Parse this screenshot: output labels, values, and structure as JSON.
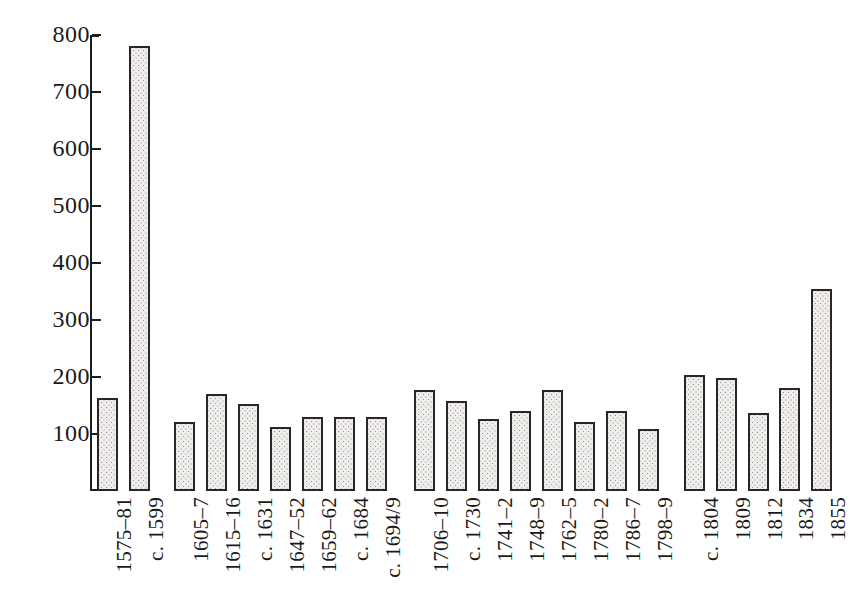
{
  "chart_data": {
    "type": "bar",
    "title": "",
    "subtitle": "",
    "xlabel": "",
    "ylabel": "",
    "ylim": [
      0,
      800
    ],
    "yticks": [
      100,
      200,
      300,
      400,
      500,
      600,
      700,
      800
    ],
    "ytick_labels": [
      "100",
      "200",
      "300",
      "400",
      "500",
      "600",
      "700",
      "800"
    ],
    "grid": false,
    "legend": null,
    "axis_style": "left spine with end caps, ticks outward",
    "bar_style": "stippled grey fill with dark outline",
    "colors": {
      "bar_fill": "#efeeec",
      "bar_dot": "#8d8a86",
      "bar_border": "#2b2623",
      "axis": "#201c1a",
      "text": "#1a1a1a",
      "background": "#ffffff"
    },
    "group_gaps_after": [
      "c. 1599",
      "c. 1694/9",
      "1798-9"
    ],
    "categories": [
      "1575–81",
      "c. 1599",
      "1605–7",
      "1615–16",
      "c. 1631",
      "1647–52",
      "1659–62",
      "c. 1684",
      "c. 1694/9",
      "1706–10",
      "c. 1730",
      "1741–2",
      "1748–9",
      "1762–5",
      "1780–2",
      "1786–7",
      "1798–9",
      "c. 1804",
      "1809",
      "1812",
      "1834",
      "1855"
    ],
    "values": [
      164,
      781,
      121,
      170,
      152,
      112,
      130,
      130,
      130,
      177,
      158,
      127,
      141,
      178,
      121,
      141,
      108,
      204,
      199,
      137,
      180,
      355
    ],
    "bars": [
      {
        "label": "1575–81",
        "value": 164,
        "x": 97,
        "group": 1
      },
      {
        "label": "c. 1599",
        "value": 781,
        "x": 129,
        "group": 1
      },
      {
        "label": "1605–7",
        "value": 121,
        "x": 174,
        "group": 2
      },
      {
        "label": "1615–16",
        "value": 170,
        "x": 206,
        "group": 2
      },
      {
        "label": "c. 1631",
        "value": 152,
        "x": 238,
        "group": 2
      },
      {
        "label": "1647–52",
        "value": 112,
        "x": 270,
        "group": 2
      },
      {
        "label": "1659–62",
        "value": 130,
        "x": 302,
        "group": 2
      },
      {
        "label": "c. 1684",
        "value": 130,
        "x": 334,
        "group": 2
      },
      {
        "label": "c. 1694/9",
        "value": 130,
        "x": 366,
        "group": 2
      },
      {
        "label": "1706–10",
        "value": 177,
        "x": 414,
        "group": 3
      },
      {
        "label": "c. 1730",
        "value": 158,
        "x": 446,
        "group": 3
      },
      {
        "label": "1741–2",
        "value": 127,
        "x": 478,
        "group": 3
      },
      {
        "label": "1748–9",
        "value": 141,
        "x": 510,
        "group": 3
      },
      {
        "label": "1762–5",
        "value": 178,
        "x": 542,
        "group": 3
      },
      {
        "label": "1780–2",
        "value": 121,
        "x": 574,
        "group": 3
      },
      {
        "label": "1786–7",
        "value": 141,
        "x": 606,
        "group": 3
      },
      {
        "label": "1798–9",
        "value": 108,
        "x": 638,
        "group": 3
      },
      {
        "label": "c. 1804",
        "value": 204,
        "x": 684,
        "group": 4
      },
      {
        "label": "1809",
        "value": 199,
        "x": 716,
        "group": 4
      },
      {
        "label": "1812",
        "value": 137,
        "x": 748,
        "group": 4
      },
      {
        "label": "1834",
        "value": 180,
        "x": 779,
        "group": 4
      },
      {
        "label": "1855",
        "value": 355,
        "x": 811,
        "group": 4
      }
    ]
  },
  "geometry": {
    "baseline_y": 491,
    "top_y": 35,
    "px_per_unit": 0.57,
    "bar_width": 21,
    "axis_x": 90
  }
}
